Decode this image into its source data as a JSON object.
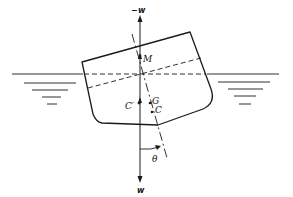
{
  "diagram": {
    "labels": {
      "top_force": "w",
      "top_force_sign": "−",
      "metacenter": "M",
      "gravity_center": "G",
      "buoyancy_center": "C",
      "original_buoyancy_center": "C′",
      "bottom_force": "w",
      "heel_angle": "θ"
    },
    "colors": {
      "line": "#1a1a1a",
      "background": "#ffffff"
    }
  }
}
